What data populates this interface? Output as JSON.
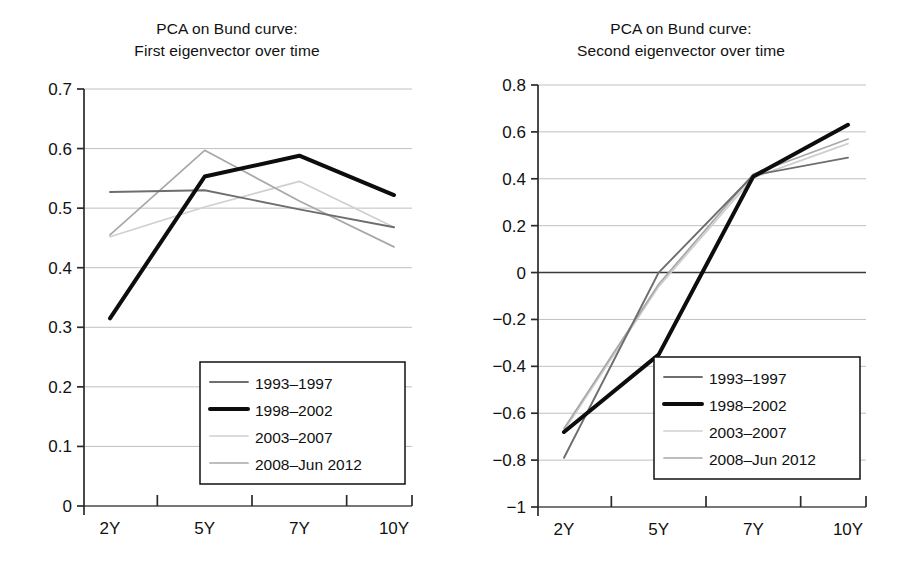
{
  "figure": {
    "background": "#ffffff",
    "panels": [
      "left",
      "right"
    ]
  },
  "series_style": {
    "1993-1997": {
      "color": "#6e6e6e",
      "width": 1.9
    },
    "1998-2002": {
      "color": "#0d0d0d",
      "width": 4.0
    },
    "2003-2007": {
      "color": "#cfcfcf",
      "width": 1.7
    },
    "2008-Jun 2012": {
      "color": "#a8a8a8",
      "width": 1.7
    }
  },
  "legend": {
    "entries": [
      {
        "label": "1993–1997",
        "key": "1993-1997"
      },
      {
        "label": "1998–2002",
        "key": "1998-2002"
      },
      {
        "label": "2003–2007",
        "key": "2003-2007"
      },
      {
        "label": "2008–Jun 2012",
        "key": "2008-Jun 2012"
      }
    ],
    "border_color": "#111111",
    "background": "#ffffff",
    "position": "lower right"
  },
  "chart_data": [
    {
      "id": "first-eigenvector",
      "type": "line",
      "title": "PCA on Bund curve:\nFirst eigenvector over time",
      "title_line1": "PCA on Bund curve:",
      "title_line2": "First eigenvector over time",
      "xlabel": "",
      "ylabel": "",
      "categories": [
        "2Y",
        "5Y",
        "7Y",
        "10Y"
      ],
      "x": [
        0,
        1,
        2,
        3
      ],
      "ylim": [
        0,
        0.7
      ],
      "yticks": [
        0,
        0.1,
        0.2,
        0.3,
        0.4,
        0.5,
        0.6,
        0.7
      ],
      "ytick_labels": [
        "0",
        "0.1",
        "0.2",
        "0.3",
        "0.4",
        "0.5",
        "0.6",
        "0.7"
      ],
      "grid": true,
      "grid_axis": "y",
      "series": [
        {
          "name": "1993–1997",
          "key": "1993-1997",
          "values": [
            0.527,
            0.53,
            0.498,
            0.468
          ]
        },
        {
          "name": "1998–2002",
          "key": "1998-2002",
          "values": [
            0.315,
            0.553,
            0.588,
            0.522
          ]
        },
        {
          "name": "2003–2007",
          "key": "2003-2007",
          "values": [
            0.452,
            0.502,
            0.545,
            0.468
          ]
        },
        {
          "name": "2008–Jun 2012",
          "key": "2008-Jun 2012",
          "values": [
            0.455,
            0.597,
            0.512,
            0.435
          ]
        }
      ]
    },
    {
      "id": "second-eigenvector",
      "type": "line",
      "title": "PCA on Bund curve:\nSecond eigenvector over time",
      "title_line1": "PCA on Bund curve:",
      "title_line2": "Second eigenvector over time",
      "xlabel": "",
      "ylabel": "",
      "categories": [
        "2Y",
        "5Y",
        "7Y",
        "10Y"
      ],
      "x": [
        0,
        1,
        2,
        3
      ],
      "ylim": [
        -1,
        0.8
      ],
      "yticks": [
        -1,
        -0.8,
        -0.6,
        -0.4,
        -0.2,
        0,
        0.2,
        0.4,
        0.6,
        0.8
      ],
      "ytick_labels": [
        "−1",
        "−0.8",
        "−0.6",
        "−0.4",
        "−0.2",
        "0",
        "0.2",
        "0.4",
        "0.6",
        "0.8"
      ],
      "grid": true,
      "grid_axis": "y",
      "series": [
        {
          "name": "1993–1997",
          "key": "1993-1997",
          "values": [
            -0.79,
            0.0,
            0.415,
            0.49
          ]
        },
        {
          "name": "1998–2002",
          "key": "1998-2002",
          "values": [
            -0.68,
            -0.35,
            0.41,
            0.63
          ]
        },
        {
          "name": "2003–2007",
          "key": "2003-2007",
          "values": [
            -0.675,
            -0.06,
            0.405,
            0.55
          ]
        },
        {
          "name": "2008–Jun 2012",
          "key": "2008-Jun 2012",
          "values": [
            -0.665,
            -0.05,
            0.42,
            0.57
          ]
        }
      ]
    }
  ]
}
